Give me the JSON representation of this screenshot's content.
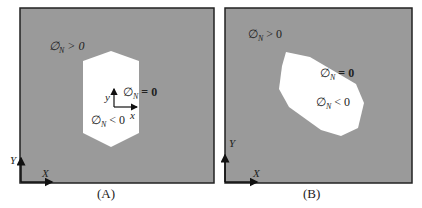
{
  "colors": {
    "domain": "#9a9a9a",
    "hole": "#ffffff",
    "frame": "#222222"
  },
  "panels": [
    {
      "caption": "(A)",
      "outside_label": "∅N > 0",
      "boundary_label": "∅N = 0",
      "inside_label": "∅N < 0",
      "global_axes": {
        "x": "X",
        "y": "Y"
      },
      "local_axes": {
        "x": "x",
        "y": "y"
      }
    },
    {
      "caption": "(B)",
      "outside_label": "∅N > 0",
      "boundary_label": "∅N = 0",
      "inside_label": "∅N < 0",
      "global_axes": {
        "x": "X",
        "y": "Y"
      }
    }
  ]
}
